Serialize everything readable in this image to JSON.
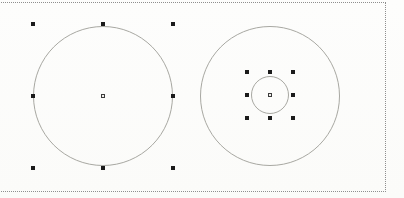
{
  "canvas": {
    "width": 404,
    "height": 198,
    "background": "#fcfcfa"
  },
  "page_border": {
    "style": "dotted",
    "color": "#8f8f8f",
    "left": -3,
    "top": 2,
    "width": 389,
    "height": 190
  },
  "circles": [
    {
      "name": "large-circle-left",
      "cx": 103,
      "cy": 96,
      "r": 70,
      "stroke": "#a8a8a2"
    },
    {
      "name": "large-circle-right",
      "cx": 270,
      "cy": 96,
      "r": 70,
      "stroke": "#a8a8a2"
    },
    {
      "name": "small-circle-inner",
      "cx": 270,
      "cy": 95,
      "r": 19,
      "stroke": "#a8a8a2"
    }
  ],
  "selections": [
    {
      "name": "selection-large-circle-left",
      "cx": 103,
      "cy": 96,
      "rx": 70,
      "ry": 72
    },
    {
      "name": "selection-small-circle-inner",
      "cx": 270,
      "cy": 95,
      "rx": 23,
      "ry": 23
    }
  ],
  "handle_style": {
    "size": 4,
    "color": "#1b1b1b"
  },
  "center_marker_style": {
    "size": 4,
    "border_color": "#3c3c3c",
    "fill": "#f1efec"
  }
}
